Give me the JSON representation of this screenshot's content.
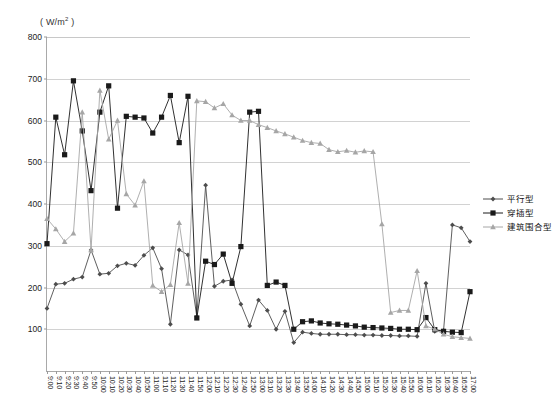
{
  "axis_unit_label": "( W/m",
  "axis_unit_sup": "2",
  "axis_unit_close": " )",
  "legend": {
    "items": [
      {
        "label": "平行型",
        "color": "#4d4d4d",
        "marker": "diamond"
      },
      {
        "label": "穿插型",
        "color": "#1a1a1a",
        "marker": "square"
      },
      {
        "label": "建筑围合型",
        "color": "#a6a6a6",
        "marker": "triangle"
      }
    ]
  },
  "chart_data": {
    "type": "line",
    "title": "",
    "xlabel": "",
    "ylabel": "(W/m2)",
    "ylim": [
      0,
      800
    ],
    "yticks": [
      100,
      200,
      300,
      400,
      500,
      600,
      700,
      800
    ],
    "grid": true,
    "legend_position": "right",
    "categories": [
      "9:00",
      "9:10",
      "9:20",
      "9:30",
      "9:40",
      "9:50",
      "10:00",
      "10:10",
      "10:20",
      "10:30",
      "10:40",
      "10:50",
      "11:00",
      "11:10",
      "11:20",
      "11:30",
      "11:40",
      "11:50",
      "12:00",
      "12:10",
      "12:20",
      "12:30",
      "12:40",
      "12:50",
      "13:00",
      "13:10",
      "13:20",
      "13:30",
      "13:40",
      "13:50",
      "14:00",
      "14:10",
      "14:20",
      "14:30",
      "14:40",
      "14:50",
      "15:00",
      "15:10",
      "15:20",
      "15:30",
      "15:40",
      "15:50",
      "16:00",
      "16:10",
      "16:20",
      "16:30",
      "16:40",
      "16:50",
      "17:00"
    ],
    "series": [
      {
        "name": "平行型",
        "color": "#4d4d4d",
        "marker": "diamond",
        "values": [
          150,
          208,
          210,
          220,
          225,
          290,
          232,
          234,
          252,
          258,
          253,
          277,
          295,
          245,
          112,
          290,
          278,
          130,
          445,
          203,
          215,
          218,
          160,
          108,
          170,
          145,
          100,
          143,
          68,
          93,
          90,
          88,
          88,
          88,
          87,
          87,
          86,
          86,
          85,
          85,
          84,
          84,
          83,
          210,
          95,
          97,
          350,
          343,
          310
        ]
      },
      {
        "name": "穿插型",
        "color": "#1a1a1a",
        "marker": "square",
        "values": [
          305,
          608,
          518,
          695,
          575,
          432,
          620,
          683,
          390,
          610,
          608,
          606,
          570,
          608,
          660,
          547,
          658,
          127,
          263,
          255,
          280,
          210,
          298,
          620,
          622,
          205,
          213,
          205,
          100,
          118,
          120,
          115,
          113,
          112,
          110,
          108,
          105,
          104,
          103,
          102,
          100,
          100,
          99,
          128,
          99,
          95,
          93,
          92,
          190
        ]
      },
      {
        "name": "建筑围合型",
        "color": "#a6a6a6",
        "marker": "triangle",
        "values": [
          365,
          340,
          310,
          330,
          620,
          290,
          672,
          555,
          600,
          424,
          397,
          455,
          205,
          190,
          207,
          355,
          210,
          647,
          645,
          630,
          640,
          613,
          600,
          600,
          590,
          583,
          575,
          568,
          560,
          552,
          547,
          545,
          530,
          525,
          528,
          524,
          527,
          525,
          352,
          140,
          145,
          145,
          240,
          108,
          100,
          88,
          82,
          80,
          78
        ]
      }
    ]
  }
}
